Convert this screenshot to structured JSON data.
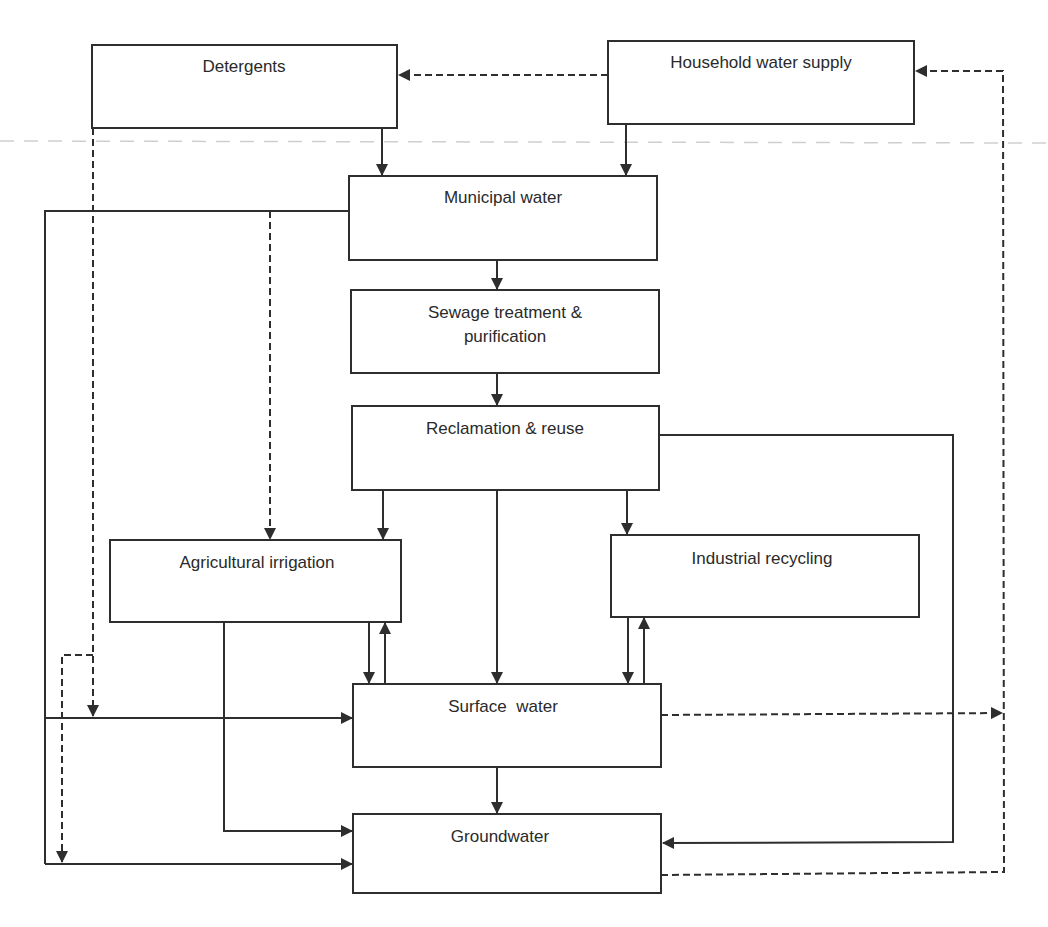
{
  "diagram": {
    "type": "flowchart",
    "colors": {
      "line": "#2e2e2e",
      "text": "#2a2a2a",
      "background": "#ffffff"
    },
    "nodes": {
      "detergents": {
        "label": "Detergents"
      },
      "household": {
        "label": "Household water supply"
      },
      "municipal": {
        "label": "Municipal water"
      },
      "sewage": {
        "label_line1": "Sewage treatment &",
        "label_line2": "purification"
      },
      "reclamation": {
        "label": "Reclamation & reuse"
      },
      "agricultural": {
        "label": "Agricultural irrigation"
      },
      "industrial": {
        "label": "Industrial recycling"
      },
      "surface": {
        "label": "Surface  water"
      },
      "groundwater": {
        "label": "Groundwater"
      }
    },
    "edges": [
      {
        "from": "household",
        "to": "detergents",
        "style": "dashed"
      },
      {
        "from": "detergents",
        "to": "municipal",
        "style": "solid"
      },
      {
        "from": "household",
        "to": "municipal",
        "style": "solid"
      },
      {
        "from": "municipal",
        "to": "sewage",
        "style": "solid"
      },
      {
        "from": "sewage",
        "to": "reclamation",
        "style": "solid"
      },
      {
        "from": "reclamation",
        "to": "agricultural",
        "style": "solid"
      },
      {
        "from": "reclamation",
        "to": "surface",
        "style": "solid"
      },
      {
        "from": "reclamation",
        "to": "industrial",
        "style": "solid"
      },
      {
        "from": "reclamation",
        "to": "groundwater",
        "style": "solid"
      },
      {
        "from": "municipal",
        "to": "agricultural",
        "style": "dashed"
      },
      {
        "from": "municipal",
        "to": "surface",
        "style": "solid"
      },
      {
        "from": "municipal",
        "to": "groundwater",
        "style": "solid"
      },
      {
        "from": "detergents",
        "to": "surface",
        "style": "dashed"
      },
      {
        "from": "detergents",
        "to": "groundwater",
        "style": "dashed"
      },
      {
        "from": "agricultural",
        "to": "surface",
        "style": "solid"
      },
      {
        "from": "surface",
        "to": "agricultural",
        "style": "solid"
      },
      {
        "from": "agricultural",
        "to": "groundwater",
        "style": "solid"
      },
      {
        "from": "industrial",
        "to": "surface",
        "style": "solid"
      },
      {
        "from": "surface",
        "to": "industrial",
        "style": "solid"
      },
      {
        "from": "surface",
        "to": "groundwater",
        "style": "solid"
      },
      {
        "from": "surface",
        "to": "household",
        "style": "dashed"
      },
      {
        "from": "groundwater",
        "to": "household",
        "style": "dashed"
      }
    ]
  }
}
